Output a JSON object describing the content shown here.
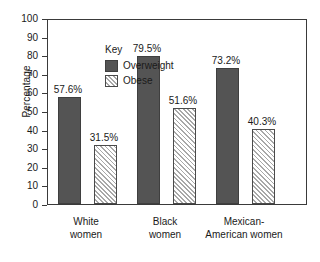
{
  "chart_data": {
    "type": "bar",
    "title": "",
    "xlabel": "",
    "ylabel": "Percentage",
    "ylim": [
      0,
      100
    ],
    "ytick_step": 10,
    "yticks": [
      100,
      90,
      80,
      70,
      60,
      50,
      40,
      30,
      20,
      10,
      0
    ],
    "ytick_labels": [
      "100",
      "90",
      "80",
      "70",
      "60",
      "50",
      "40",
      "30",
      "20",
      "10",
      "0"
    ],
    "grid": false,
    "legend_title": "Key",
    "legend_position": "inside-top-left",
    "categories": [
      "White women",
      "Black women",
      "Mexican-American women"
    ],
    "category_lines": [
      [
        "White",
        "women"
      ],
      [
        "Black",
        "women"
      ],
      [
        "Mexican-",
        "American women"
      ]
    ],
    "series": [
      {
        "name": "Overweight",
        "color": "#545454",
        "fill": "solid",
        "values": [
          57.6,
          79.5,
          73.2
        ],
        "labels": [
          "57.6%",
          "79.5%",
          "73.2%"
        ]
      },
      {
        "name": "Obese",
        "color": "#ffffff",
        "fill": "diagonal-hatch",
        "values": [
          31.5,
          51.6,
          40.3
        ],
        "labels": [
          "31.5%",
          "51.6%",
          "40.3%"
        ]
      }
    ]
  }
}
